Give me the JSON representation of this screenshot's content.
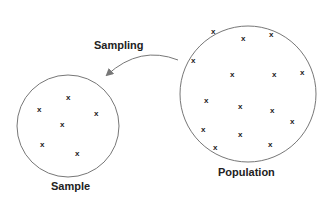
{
  "labels": {
    "sampling": "Sampling",
    "sample": "Sample",
    "population": "Population"
  },
  "marker": "x",
  "colors": {
    "stroke": "#777777",
    "text": "#222222"
  },
  "population": {
    "center": [
      248,
      94
    ],
    "radius": 68,
    "points": [
      [
        213,
        31
      ],
      [
        243,
        38
      ],
      [
        271,
        34
      ],
      [
        193,
        60
      ],
      [
        232,
        74
      ],
      [
        274,
        74
      ],
      [
        302,
        72
      ],
      [
        206,
        100
      ],
      [
        240,
        106
      ],
      [
        272,
        110
      ],
      [
        292,
        121
      ],
      [
        203,
        129
      ],
      [
        240,
        134
      ],
      [
        270,
        144
      ],
      [
        215,
        147
      ]
    ]
  },
  "sample": {
    "center": [
      68,
      126
    ],
    "radius": 51,
    "points": [
      [
        68,
        97
      ],
      [
        39,
        109
      ],
      [
        96,
        113
      ],
      [
        62,
        124
      ],
      [
        42,
        144
      ],
      [
        77,
        153
      ]
    ]
  }
}
